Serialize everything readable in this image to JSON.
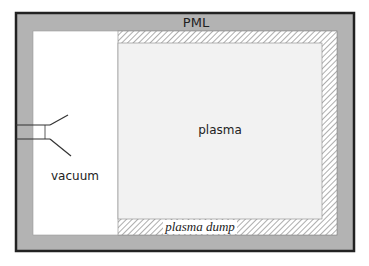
{
  "diagram": {
    "labels": {
      "pml": "PML",
      "plasma": "plasma",
      "vacuum": "vacuum",
      "plasma_dump": "plasma dump"
    },
    "colors": {
      "pml_fill": "#b3b3b3",
      "outer_border": "#222222",
      "vacuum_fill": "#ffffff",
      "plasma_fill": "#f2f2f2",
      "hatch_line": "#777777",
      "text": "#222222"
    },
    "regions": [
      {
        "name": "PML",
        "role": "absorbing boundary layer"
      },
      {
        "name": "vacuum",
        "role": "source region with antenna/horn"
      },
      {
        "name": "plasma",
        "role": "plasma domain"
      },
      {
        "name": "plasma dump",
        "role": "hatched absorbing layer around plasma"
      }
    ]
  }
}
